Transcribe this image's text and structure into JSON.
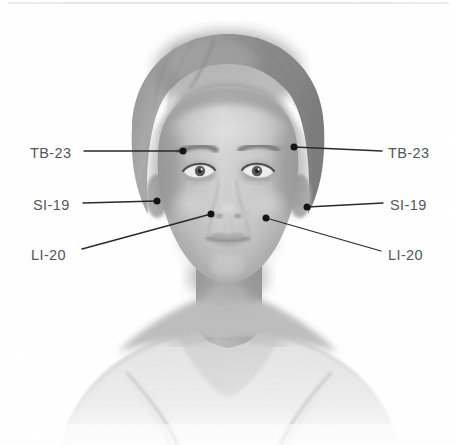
{
  "figure": {
    "width": 457,
    "height": 445,
    "background_color": "#ffffff"
  },
  "style": {
    "label_text_color": "#53565a",
    "leader_line_color": "#2a2a2a",
    "point_marker_color": "#1a1a1a",
    "label_font_size_px": 14.5,
    "leader_line_width_px": 1.3,
    "point_marker_radius_px": 3.4,
    "top_rule_color": "#e4e4e4"
  },
  "annotations": {
    "left": [
      {
        "id": "tb-23-left",
        "label": "TB-23",
        "label_x": 30,
        "label_y": 146,
        "line_start_x": 84,
        "line_start_y": 151,
        "point_x": 183,
        "point_y": 151
      },
      {
        "id": "si-19-left",
        "label": "SI-19",
        "label_x": 33,
        "label_y": 198,
        "line_start_x": 83,
        "line_start_y": 203,
        "point_x": 157,
        "point_y": 201
      },
      {
        "id": "li-20-left",
        "label": "LI-20",
        "label_x": 31,
        "label_y": 248,
        "line_start_x": 82,
        "line_start_y": 249,
        "point_x": 211,
        "point_y": 214
      }
    ],
    "right": [
      {
        "id": "tb-23-right",
        "label": "TB-23",
        "label_x": 388,
        "label_y": 146,
        "line_start_x": 382,
        "line_start_y": 151,
        "point_x": 294,
        "point_y": 147
      },
      {
        "id": "si-19-right",
        "label": "SI-19",
        "label_x": 390,
        "label_y": 198,
        "line_start_x": 383,
        "line_start_y": 203,
        "point_x": 307,
        "point_y": 207
      },
      {
        "id": "li-20-right",
        "label": "LI-20",
        "label_x": 388,
        "label_y": 248,
        "line_start_x": 381,
        "line_start_y": 251,
        "point_x": 266,
        "point_y": 218
      }
    ]
  },
  "point_names": {
    "tb_23": "TB-23",
    "si_19": "SI-19",
    "li_20": "LI-20"
  }
}
